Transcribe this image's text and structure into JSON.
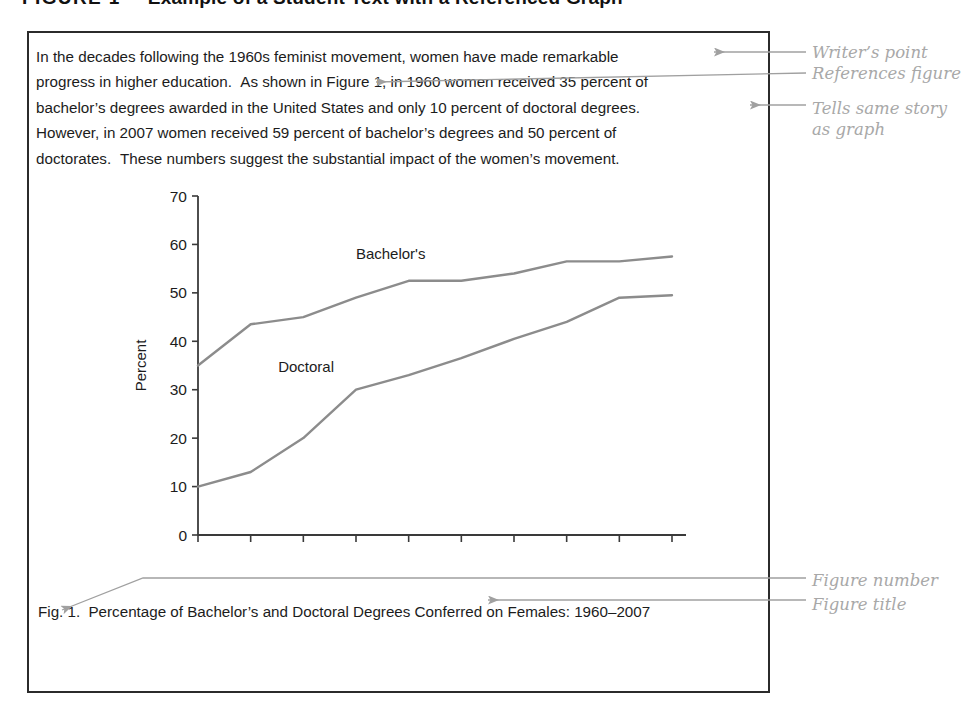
{
  "heading": {
    "figure_number": "FIGURE 1",
    "title": "Example of a Student Text with a Referenced Graph"
  },
  "student_text": {
    "line1": "In the decades following the 1960s feminist movement, women have made remarkable",
    "line2a": "progress in higher education.",
    "line2b": "As shown in Figure 1, in 1960 women received 35 percent of",
    "line3": "bachelor’s degrees awarded in the United States and only 10 percent of doctoral degrees.",
    "line4": "However, in 2007 women received 59 percent of bachelor’s degrees and 50 percent of",
    "line5a": "doctorates.",
    "line5b": "These numbers suggest the substantial impact of the women’s movement."
  },
  "caption": {
    "figure_number": "Fig. 1.",
    "title": "Percentage of Bachelor’s and Doctoral Degrees Conferred on Females: 1960–2007"
  },
  "annotations": {
    "writers_point": "Writer’s point",
    "references_figure": "References figure",
    "tells_same_story_line1": "Tells same story",
    "tells_same_story_line2": "as graph",
    "figure_number": "Figure number",
    "figure_title": "Figure title"
  },
  "chart_data": {
    "type": "line",
    "title": "",
    "xlabel": "",
    "ylabel": "Percent",
    "categories": [
      "1960",
      "1970",
      "1975",
      "1980",
      "1985",
      "1990",
      "1995",
      "2000",
      "2005",
      "2007"
    ],
    "ylim": [
      0,
      70
    ],
    "yticks": [
      0,
      10,
      20,
      30,
      40,
      50,
      60,
      70
    ],
    "grid": false,
    "legend": "inline-labels",
    "line_color": "#8c8c8c",
    "axis_color": "#3a3a3a",
    "series": [
      {
        "name": "Bachelor's",
        "values": [
          35,
          43.5,
          45,
          49,
          52.5,
          52.5,
          54,
          56.5,
          56.5,
          57.5
        ]
      },
      {
        "name": "Doctoral",
        "values": [
          10,
          13,
          20,
          30,
          33,
          36.5,
          40.5,
          44,
          49,
          49.5
        ]
      }
    ]
  }
}
